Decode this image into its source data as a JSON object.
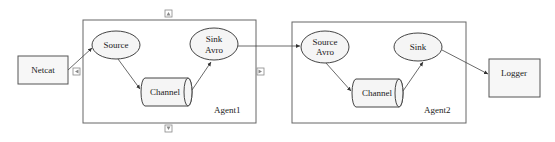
{
  "diagram": {
    "nodes": {
      "netcat": "Netcat",
      "agent1_source": "Source",
      "agent1_channel": "Channel",
      "agent1_sink_line1": "Sink",
      "agent1_sink_line2": "Avro",
      "agent1_label": "Agent1",
      "agent2_source_line1": "Source",
      "agent2_source_line2": "Avro",
      "agent2_channel": "Channel",
      "agent2_sink": "Sink",
      "agent2_label": "Agent2",
      "logger": "Logger"
    },
    "edges": [
      {
        "from": "Netcat",
        "to": "Source"
      },
      {
        "from": "Source",
        "to": "Channel"
      },
      {
        "from": "Channel",
        "to": "Sink Avro"
      },
      {
        "from": "Sink Avro",
        "to": "Source Avro"
      },
      {
        "from": "Source Avro",
        "to": "Channel"
      },
      {
        "from": "Channel",
        "to": "Sink"
      },
      {
        "from": "Sink",
        "to": "Logger"
      }
    ],
    "handles": [
      "resize-top",
      "resize-left",
      "resize-right",
      "resize-bottom"
    ]
  }
}
